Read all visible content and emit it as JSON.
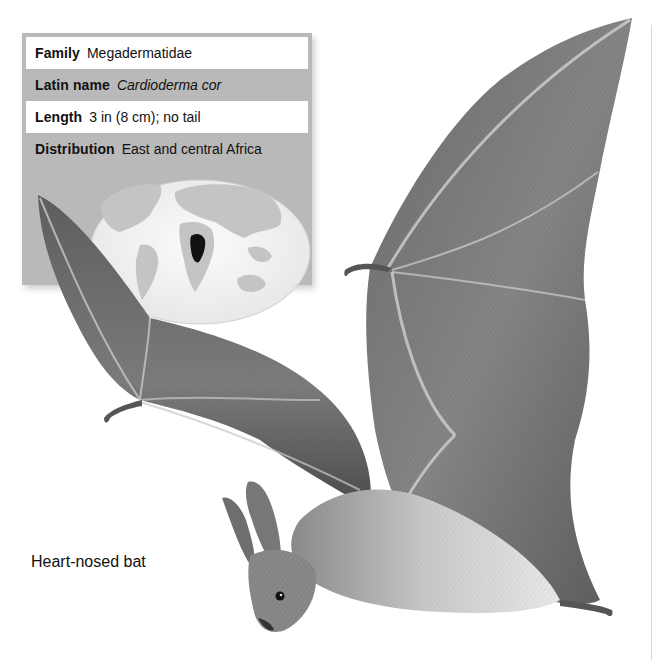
{
  "fact_box": {
    "rows": [
      {
        "label": "Family",
        "value": "Megadermatidae",
        "italic": false
      },
      {
        "label": "Latin name",
        "value": "Cardioderma cor",
        "italic": true
      },
      {
        "label": "Length",
        "value": "3 in (8 cm); no tail",
        "italic": false
      },
      {
        "label": "Distribution",
        "value": "East and central Africa",
        "italic": false
      }
    ],
    "map": {
      "highlighted_region": "East and central Africa",
      "colors": {
        "ocean": "#f2f2f2",
        "land": "#bdbdbd",
        "range": "#111111",
        "panel": "#b9b9b9"
      }
    }
  },
  "illustration": {
    "subject": "bat-in-flight",
    "caption": "Heart-nosed bat"
  }
}
